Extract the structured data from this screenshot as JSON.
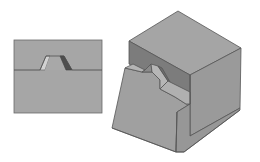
{
  "figure": {
    "colors": {
      "background": "#ffffff",
      "face_light": "#a3a3a3",
      "face_mid": "#999999",
      "face_dark": "#7d7d7d",
      "face_darkest": "#5a5a5a",
      "facet_highlight": "#cfcfcf",
      "edge": "#555555"
    }
  },
  "panel_2d": {
    "name": "section-view",
    "rect": {
      "x": 14,
      "y": 40,
      "w": 88,
      "h": 73
    },
    "baseline_y": 70,
    "ridge": {
      "bottom_left": [
        40,
        70
      ],
      "top_left": [
        49,
        56
      ],
      "top_right": [
        60,
        56
      ],
      "bottom_right": [
        72,
        70
      ]
    }
  },
  "block_3d": {
    "name": "isometric-block"
  }
}
